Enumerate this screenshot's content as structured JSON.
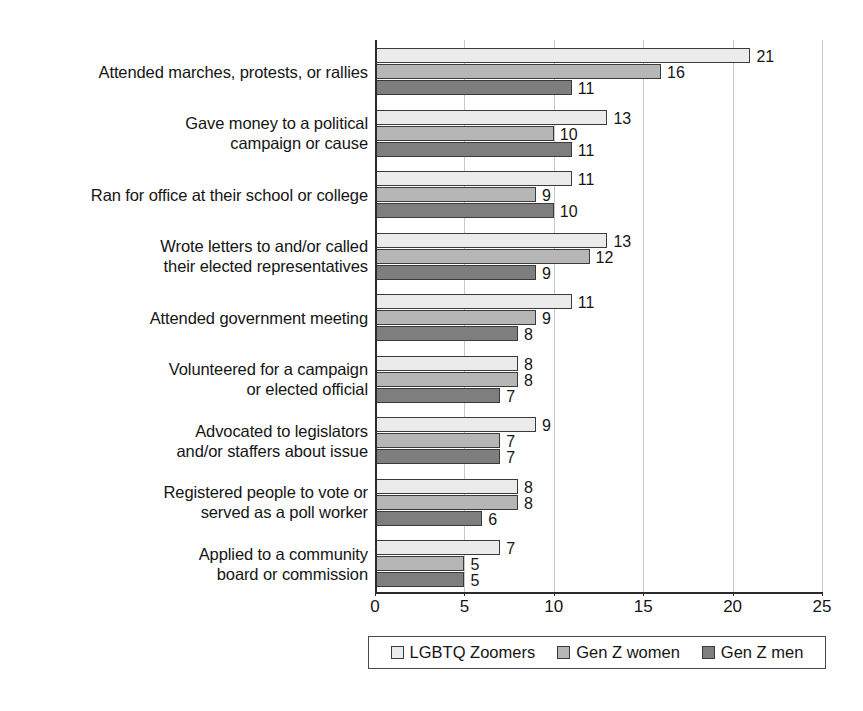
{
  "chart_data": {
    "type": "bar",
    "orientation": "horizontal",
    "title": "",
    "subtitle": "",
    "xlabel": "",
    "ylabel": "",
    "xlim": [
      0,
      25
    ],
    "xticks": [
      0,
      5,
      10,
      15,
      20,
      25
    ],
    "xtick_labels": [
      "0",
      "5",
      "10",
      "15",
      "20",
      "25"
    ],
    "grid": true,
    "grid_axis": "x",
    "legend_position": "bottom",
    "categories": [
      "Attended marches, protests, or rallies",
      "Gave money to a political\ncampaign or cause",
      "Ran for office at their school or college",
      "Wrote letters to and/or called\ntheir elected representatives",
      "Attended government meeting",
      "Volunteered for a campaign\nor elected official",
      "Advocated to legislators\nand/or staffers about issue",
      "Registered people to vote or\nserved as a poll worker",
      "Applied to a community\nboard or commission"
    ],
    "series": [
      {
        "name": "LGBTQ Zoomers",
        "color": "#ebebeb",
        "values": [
          21,
          13,
          11,
          13,
          11,
          8,
          9,
          8,
          7
        ]
      },
      {
        "name": "Gen Z women",
        "color": "#b6b6b6",
        "values": [
          16,
          10,
          9,
          12,
          9,
          8,
          7,
          8,
          5
        ]
      },
      {
        "name": "Gen Z men",
        "color": "#7e7e7e",
        "values": [
          11,
          11,
          10,
          9,
          8,
          7,
          7,
          6,
          5
        ]
      }
    ]
  }
}
